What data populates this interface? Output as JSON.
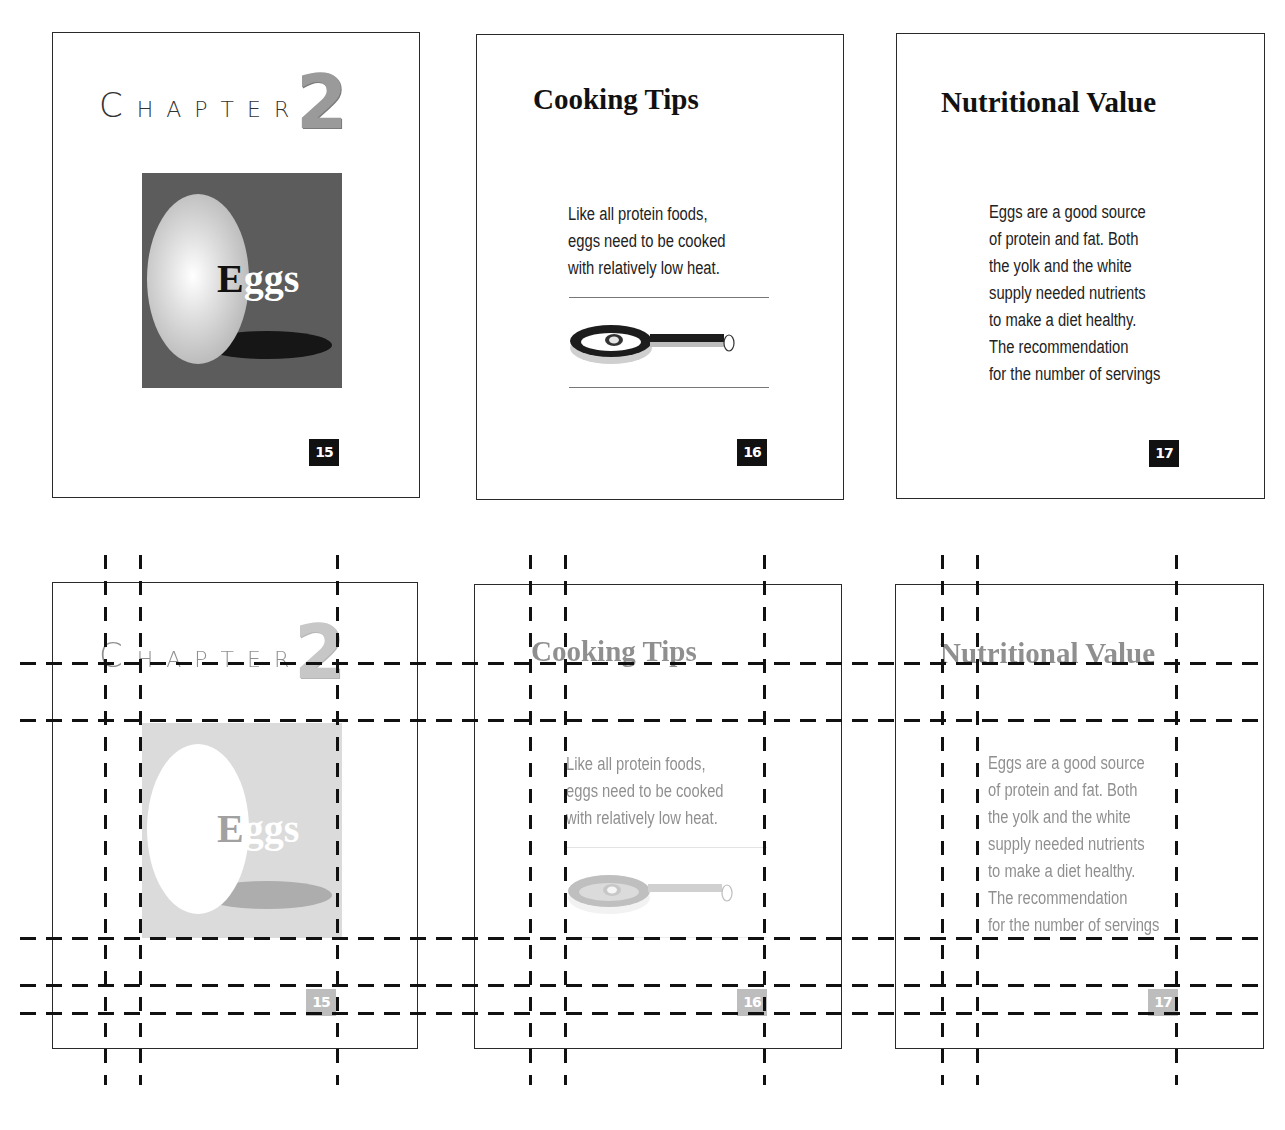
{
  "top_row": {
    "pages": [
      {
        "id": "page-15",
        "box": {
          "x": 52,
          "y": 32,
          "w": 368,
          "h": 466
        },
        "chapter_label": "CHAPTER",
        "chapter_label_first": "C",
        "chapter_label_rest": "HAPTER",
        "chapter_number": "2",
        "image_label_first": "E",
        "image_label_rest": "ggs",
        "page_number": "15"
      },
      {
        "id": "page-16",
        "box": {
          "x": 476,
          "y": 34,
          "w": 368,
          "h": 466
        },
        "title": "Cooking Tips",
        "body_lines": [
          "Like all protein foods,",
          "eggs need to be cooked",
          "with relatively low heat."
        ],
        "illustration": "frying-pan-with-egg",
        "page_number": "16"
      },
      {
        "id": "page-17",
        "box": {
          "x": 896,
          "y": 33,
          "w": 369,
          "h": 466
        },
        "title": "Nutritional Value",
        "body_lines": [
          "Eggs are a good source",
          "of protein and fat. Both",
          "the yolk and the white",
          "supply needed nutrients",
          "to make a diet healthy.",
          "The recommendation",
          "for the number of servings"
        ],
        "page_number": "17"
      }
    ]
  },
  "bottom_row": {
    "description": "Same three pages shown faded with layout grid guides overlaid",
    "pages": [
      {
        "id": "page-15-grid",
        "box": {
          "x": 52,
          "y": 582,
          "w": 366,
          "h": 467
        },
        "page_number": "15"
      },
      {
        "id": "page-16-grid",
        "box": {
          "x": 474,
          "y": 584,
          "w": 368,
          "h": 465
        },
        "page_number": "16"
      },
      {
        "id": "page-17-grid",
        "box": {
          "x": 895,
          "y": 584,
          "w": 369,
          "h": 465
        },
        "page_number": "17"
      }
    ],
    "guides": {
      "horizontal_y": [
        663,
        720,
        938,
        985,
        1013
      ],
      "horizontal_span": [
        20,
        1268
      ],
      "vertical_x": [
        105,
        140,
        337,
        530,
        565,
        764,
        942,
        977,
        1176
      ],
      "vertical_span": [
        555,
        1085
      ]
    }
  },
  "colors": {
    "page_border": "#2a2a2a",
    "badge_bg": "#111111",
    "image_bg": "#5c5c5c",
    "chapter_number": "#9a9a9a",
    "guide": "#111111"
  }
}
